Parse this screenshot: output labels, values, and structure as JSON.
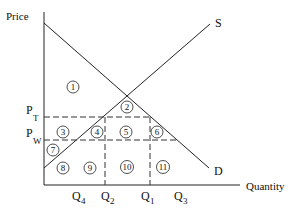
{
  "diagram": {
    "type": "supply-demand-tariff",
    "axis_labels": {
      "y": "Price",
      "x": "Quantity"
    },
    "curve_labels": {
      "supply": "S",
      "demand": "D"
    },
    "price_labels": [
      {
        "id": "pt",
        "base": "P",
        "sub": "T"
      },
      {
        "id": "pw",
        "base": "P",
        "sub": "W"
      }
    ],
    "quantity_labels": [
      {
        "id": "q4",
        "base": "Q",
        "sub": "4"
      },
      {
        "id": "q2",
        "base": "Q",
        "sub": "2"
      },
      {
        "id": "q1",
        "base": "Q",
        "sub": "1"
      },
      {
        "id": "q3",
        "base": "Q",
        "sub": "3"
      }
    ],
    "regions": [
      "1",
      "2",
      "3",
      "4",
      "5",
      "6",
      "7",
      "8",
      "9",
      "10",
      "11"
    ],
    "colors": {
      "line": "#222222",
      "dash": "#333333",
      "background": "#ffffff"
    }
  }
}
